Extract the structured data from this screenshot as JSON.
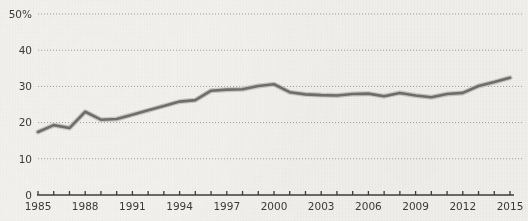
{
  "chart_data": {
    "type": "line",
    "title": "",
    "subtitle": "",
    "xlabel": "",
    "ylabel": "",
    "xlim": [
      1985,
      2015
    ],
    "ylim": [
      0,
      50
    ],
    "grid": "horizontal-dotted",
    "legend": "none",
    "y_axis": {
      "ticks": [
        0,
        10,
        20,
        30,
        40,
        50
      ],
      "tick_labels": [
        "0",
        "10",
        "20",
        "30",
        "40",
        "50%"
      ],
      "unit": "%"
    },
    "x_axis": {
      "ticks": [
        1985,
        1986,
        1987,
        1988,
        1989,
        1990,
        1991,
        1992,
        1993,
        1994,
        1995,
        1996,
        1997,
        1998,
        1999,
        2000,
        2001,
        2002,
        2003,
        2004,
        2005,
        2006,
        2007,
        2008,
        2009,
        2010,
        2011,
        2012,
        2013,
        2014,
        2015
      ],
      "labeled_ticks": [
        1985,
        1988,
        1991,
        1994,
        1997,
        2000,
        2003,
        2006,
        2009,
        2012,
        2015
      ],
      "tick_labels": [
        "1985",
        "1988",
        "1991",
        "1994",
        "1997",
        "2000",
        "2003",
        "2006",
        "2009",
        "2012",
        "2015"
      ]
    },
    "x": [
      1985,
      1986,
      1987,
      1988,
      1989,
      1990,
      1991,
      1992,
      1993,
      1994,
      1995,
      1996,
      1997,
      1998,
      1999,
      2000,
      2001,
      2002,
      2003,
      2004,
      2005,
      2006,
      2007,
      2008,
      2009,
      2010,
      2011,
      2012,
      2013,
      2014,
      2015
    ],
    "values": [
      17.4,
      19.3,
      18.5,
      23.0,
      20.8,
      21.0,
      22.2,
      23.4,
      24.6,
      25.8,
      26.2,
      28.8,
      29.1,
      29.2,
      30.1,
      30.6,
      28.4,
      27.8,
      27.6,
      27.5,
      27.9,
      28.0,
      27.3,
      28.2,
      27.5,
      27.0,
      27.9,
      28.2,
      30.1,
      31.2,
      32.4
    ],
    "series": [
      {
        "name": "Series 1",
        "color": "#6f6f6d",
        "values": [
          17.4,
          19.3,
          18.5,
          23.0,
          20.8,
          21.0,
          22.2,
          23.4,
          24.6,
          25.8,
          26.2,
          28.8,
          29.1,
          29.2,
          30.1,
          30.6,
          28.4,
          27.8,
          27.6,
          27.5,
          27.9,
          28.0,
          27.3,
          28.2,
          27.5,
          27.0,
          27.9,
          28.2,
          30.1,
          31.2,
          32.4
        ]
      }
    ],
    "colors": {
      "background": "#f2f1ee",
      "line": "#6f6f6d",
      "grid": "#8e8d88",
      "axis": "#3c3c3a",
      "text": "#3a3a38"
    }
  }
}
